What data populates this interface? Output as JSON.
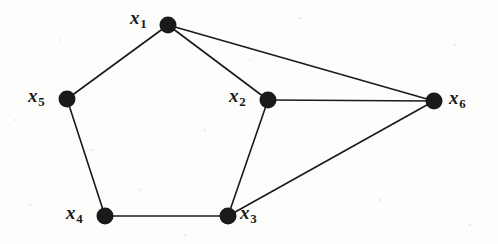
{
  "figure": {
    "type": "undirected-graph-diagram",
    "background_color": "#fdfdfb",
    "ink_color": "#1a1a1a",
    "width": 498,
    "height": 244
  },
  "graph": {
    "node_radius": 8.5,
    "edge_width": 1.6,
    "nodes": [
      {
        "id": "x1",
        "var": "x",
        "sub": "1",
        "cx": 168,
        "cy": 25,
        "label_x": 130,
        "label_y": 8,
        "label_side": "left"
      },
      {
        "id": "x2",
        "var": "x",
        "sub": "2",
        "cx": 268,
        "cy": 100,
        "label_x": 229,
        "label_y": 86,
        "label_side": "left"
      },
      {
        "id": "x3",
        "var": "x",
        "sub": "3",
        "cx": 228,
        "cy": 216,
        "label_x": 240,
        "label_y": 203,
        "label_side": "right"
      },
      {
        "id": "x4",
        "var": "x",
        "sub": "4",
        "cx": 105,
        "cy": 216,
        "label_x": 66,
        "label_y": 203,
        "label_side": "left"
      },
      {
        "id": "x5",
        "var": "x",
        "sub": "5",
        "cx": 67,
        "cy": 99,
        "label_x": 28,
        "label_y": 86,
        "label_side": "left"
      },
      {
        "id": "x6",
        "var": "x",
        "sub": "6",
        "cx": 434,
        "cy": 101,
        "label_x": 449,
        "label_y": 88,
        "label_side": "right"
      }
    ],
    "edges": [
      {
        "from": "x1",
        "to": "x5"
      },
      {
        "from": "x1",
        "to": "x2"
      },
      {
        "from": "x1",
        "to": "x6"
      },
      {
        "from": "x2",
        "to": "x6"
      },
      {
        "from": "x2",
        "to": "x3"
      },
      {
        "from": "x3",
        "to": "x6"
      },
      {
        "from": "x3",
        "to": "x4"
      },
      {
        "from": "x4",
        "to": "x5"
      }
    ]
  }
}
